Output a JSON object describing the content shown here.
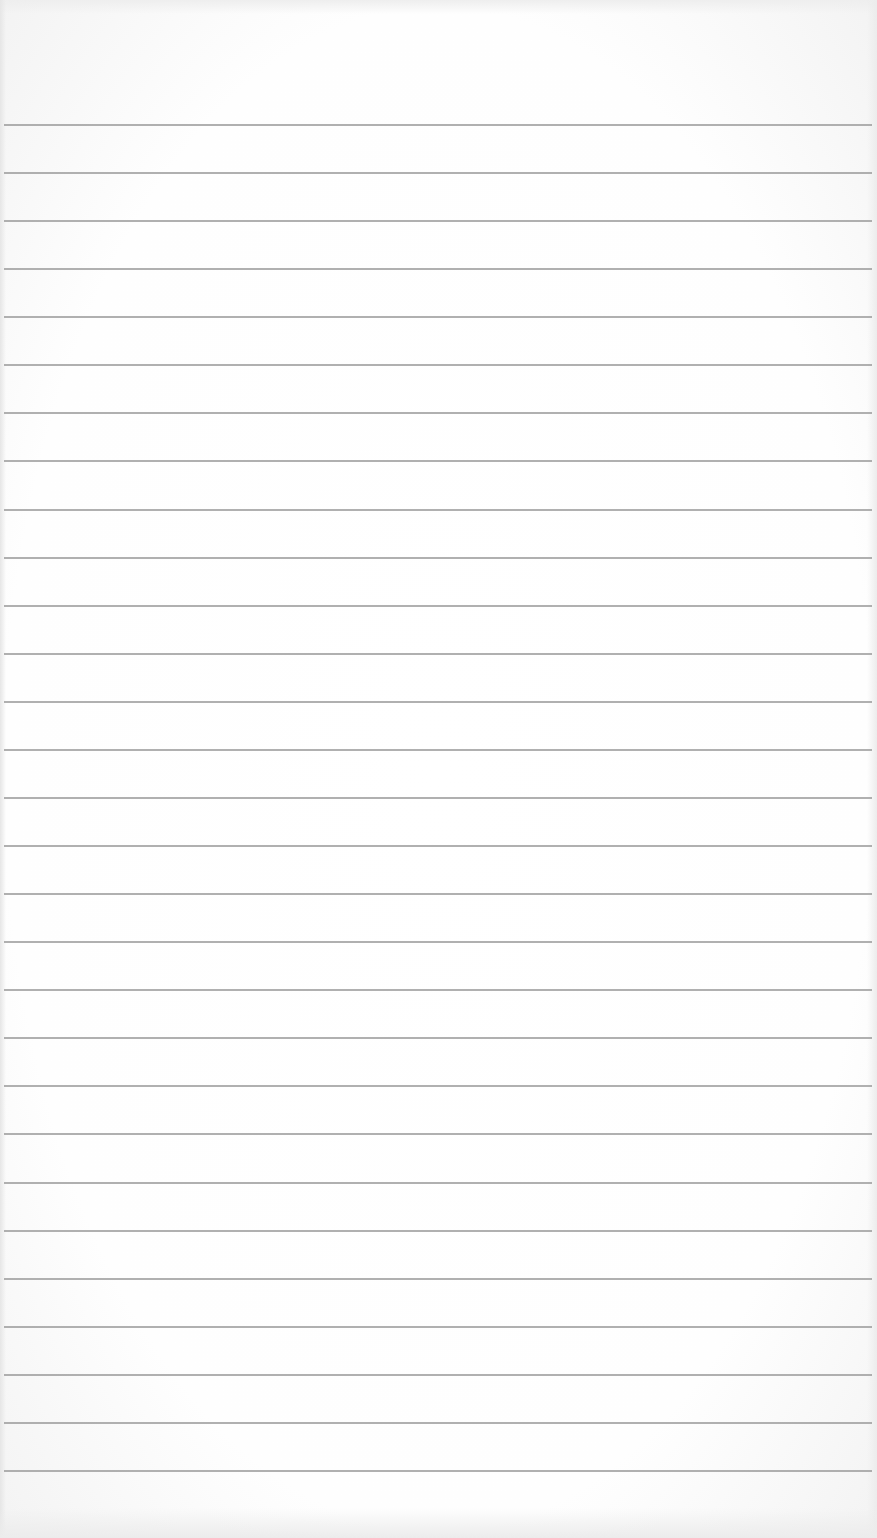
{
  "page": {
    "type": "lined-paper",
    "background_color": "#ffffff",
    "line_color": "#a2a2a2"
  },
  "ruled_lines": {
    "count": 29,
    "first_y": 125,
    "spacing": 48.07,
    "left": 4,
    "width": 868
  }
}
